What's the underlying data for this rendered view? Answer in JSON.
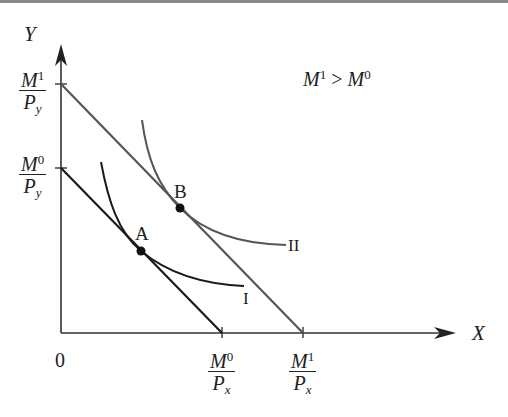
{
  "diagram": {
    "axes": {
      "y_label": "Y",
      "x_label": "X",
      "origin_label": "0"
    },
    "y_intercepts": [
      {
        "num": "M",
        "num_sup": "1",
        "den": "P",
        "den_sub": "y"
      },
      {
        "num": "M",
        "num_sup": "0",
        "den": "P",
        "den_sub": "y"
      }
    ],
    "x_intercepts": [
      {
        "num": "M",
        "num_sup": "0",
        "den": "P",
        "den_sub": "x"
      },
      {
        "num": "M",
        "num_sup": "1",
        "den": "P",
        "den_sub": "x"
      }
    ],
    "condition": {
      "left": "M",
      "left_sup": "1",
      "op": " > ",
      "right": "M",
      "right_sup": "0"
    },
    "points": [
      {
        "label": "A"
      },
      {
        "label": "B"
      }
    ],
    "curves": [
      {
        "label": "I"
      },
      {
        "label": "II"
      }
    ],
    "colors": {
      "budget_line_0": "#1a1a1a",
      "budget_line_1": "#555555",
      "curve_I": "#1a1a1a",
      "curve_II": "#555555",
      "axes": "#333333",
      "top_rule": "#8a8a8a"
    }
  }
}
